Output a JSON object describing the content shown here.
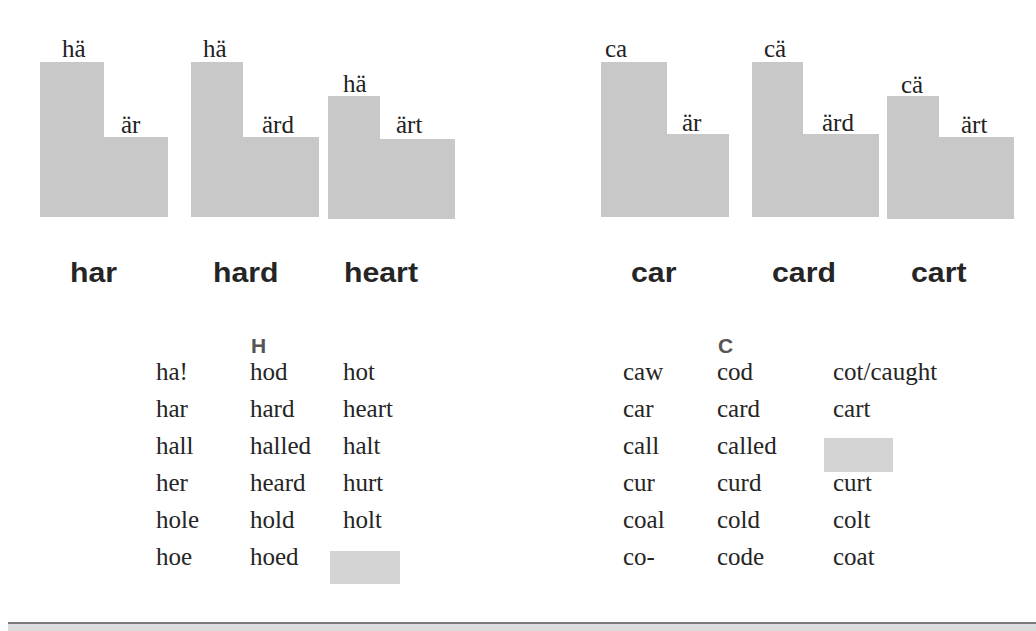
{
  "colors": {
    "shape_fill": "#c8c8c8",
    "blank_cell": "#d4d4d4",
    "text": "#252525",
    "header": "#555555",
    "rule": "#7a7a7a"
  },
  "diagrams": [
    {
      "group": "H",
      "word": "har",
      "first_syllable": "hä",
      "second_syllable": "är",
      "onset": "tall"
    },
    {
      "group": "H",
      "word": "hard",
      "first_syllable": "hä",
      "second_syllable": "ärd",
      "onset": "tall"
    },
    {
      "group": "H",
      "word": "heart",
      "first_syllable": "hä",
      "second_syllable": "ärt",
      "onset": "short"
    },
    {
      "group": "C",
      "word": "car",
      "first_syllable": "ca",
      "second_syllable": "är",
      "onset": "tall"
    },
    {
      "group": "C",
      "word": "card",
      "first_syllable": "cä",
      "second_syllable": "ärd",
      "onset": "tall"
    },
    {
      "group": "C",
      "word": "cart",
      "first_syllable": "cä",
      "second_syllable": "ärt",
      "onset": "short"
    }
  ],
  "tables": {
    "H": {
      "header": "H",
      "rows": [
        [
          "ha!",
          "hod",
          "hot"
        ],
        [
          "har",
          "hard",
          "heart"
        ],
        [
          "hall",
          "halled",
          "halt"
        ],
        [
          "her",
          "heard",
          "hurt"
        ],
        [
          "hole",
          "hold",
          "holt"
        ],
        [
          "hoe",
          "hoed",
          ""
        ]
      ]
    },
    "C": {
      "header": "C",
      "rows": [
        [
          "caw",
          "cod",
          "cot/caught"
        ],
        [
          "car",
          "card",
          "cart"
        ],
        [
          "call",
          "called",
          ""
        ],
        [
          "cur",
          "curd",
          "curt"
        ],
        [
          "coal",
          "cold",
          "colt"
        ],
        [
          "co-",
          "code",
          "coat"
        ]
      ]
    }
  }
}
